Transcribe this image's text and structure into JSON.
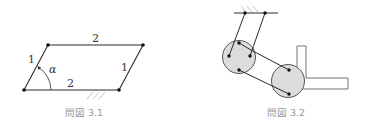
{
  "figures": [
    {
      "id": "3.1",
      "caption": "問図 3.1",
      "labels": {
        "left_side": "1",
        "top_side": "2",
        "right_side": "1",
        "bottom_side": "2",
        "angle": "α"
      }
    },
    {
      "id": "3.2",
      "caption": "問図 3.2"
    }
  ],
  "colors": {
    "line": "#2a2a2a",
    "circle_fill": "#dcdcdc",
    "caption": "#999999",
    "hatch": "#bbbbbb",
    "bracket": "#777777"
  }
}
